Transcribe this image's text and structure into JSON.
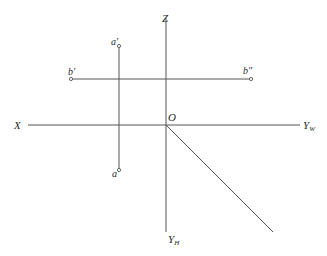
{
  "diagram": {
    "type": "orthographic-projection-axes",
    "colors": {
      "line": "#555555",
      "text": "#2a2a2a",
      "background": "#ffffff"
    },
    "axes": {
      "z": {
        "label": "Z"
      },
      "x": {
        "label": "X"
      },
      "origin": {
        "label": "O"
      },
      "yw": {
        "label": "Y",
        "sub": "W"
      },
      "yh": {
        "label": "Y",
        "sub": "H"
      }
    },
    "points": {
      "a_prime": {
        "label": "a′"
      },
      "a": {
        "label": "a"
      },
      "b_prime": {
        "label": "b′"
      },
      "b_double_prime": {
        "label": "b″"
      }
    }
  }
}
